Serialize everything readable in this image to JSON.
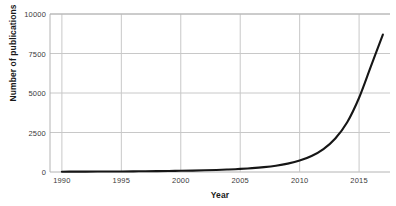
{
  "chart_data": {
    "type": "line",
    "title": "",
    "xlabel": "Year",
    "ylabel": "Number of publications",
    "xlim": [
      1989.0,
      2017.6
    ],
    "ylim": [
      0,
      10000
    ],
    "grid": true,
    "legend": null,
    "line_color": "#161616",
    "grid_color": "#c8c8c8",
    "axis_color": "#b4b4b4",
    "x_ticks": [
      "1990",
      "1995",
      "2000",
      "2005",
      "2010",
      "2015"
    ],
    "x_tick_values": [
      1990,
      1995,
      2000,
      2005,
      2010,
      2015
    ],
    "y_ticks": [
      "0",
      "2500",
      "5000",
      "7500",
      "10000"
    ],
    "y_tick_values": [
      0,
      2500,
      5000,
      7500,
      10000
    ],
    "x": [
      1990,
      1991,
      1992,
      1993,
      1994,
      1995,
      1996,
      1997,
      1998,
      1999,
      2000,
      2001,
      2002,
      2003,
      2004,
      2005,
      2006,
      2007,
      2008,
      2009,
      2010,
      2011,
      2012,
      2013,
      2014,
      2015,
      2016,
      2017
    ],
    "values": [
      20,
      22,
      25,
      28,
      32,
      36,
      42,
      48,
      56,
      65,
      76,
      90,
      108,
      130,
      158,
      195,
      245,
      310,
      400,
      530,
      720,
      1010,
      1450,
      2120,
      3150,
      4700,
      6700,
      8700
    ],
    "series": [
      {
        "name": "Number of publications",
        "values": [
          20,
          22,
          25,
          28,
          32,
          36,
          42,
          48,
          56,
          65,
          76,
          90,
          108,
          130,
          158,
          195,
          245,
          310,
          400,
          530,
          720,
          1010,
          1450,
          2120,
          3150,
          4700,
          6700,
          8700
        ]
      }
    ],
    "annotations": []
  }
}
